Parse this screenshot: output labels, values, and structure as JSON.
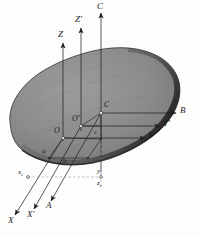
{
  "figure": {
    "kind": "rigid-body-coordinate-systems-diagram",
    "background_color": "#fdfdfc",
    "body": {
      "name": "irregular-rigid-body-blob",
      "fill_color": "#8e8e8e",
      "edge_color": "#3a3a3a",
      "shadow_color": "#2a2a2a"
    },
    "line_color": "#2b2b2b",
    "dash_color": "#9a9a9a"
  },
  "labels": {
    "axis_Z": "Z",
    "axis_Zprime": "Z'",
    "axis_C": "C",
    "axis_B": "B",
    "axis_Yprime": "Y'",
    "axis_Y": "Y",
    "axis_X": "X",
    "axis_Xprime": "X'",
    "axis_A": "A",
    "origin_O": "O",
    "origin_Oprime": "O'",
    "point_C": "C",
    "point_c": "c",
    "point_a": "a",
    "point_b": "b",
    "proj_x": "x",
    "proj_x_sub": "c",
    "proj_y": "y",
    "proj_y_sub": "c",
    "proj_z": "z",
    "proj_z_sub": "c"
  }
}
